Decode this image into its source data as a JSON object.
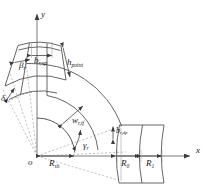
{
  "figure": {
    "kind": "engineering-geometry-diagram",
    "background_color": "#ffffff",
    "line_color": "#3c3c3c",
    "dashed_color": "#8c8c8c",
    "text_color": "#1a1a1a"
  },
  "axes": {
    "y_label": "y",
    "x_label": "x",
    "origin_label": "o"
  },
  "labels": {
    "beta": {
      "base": "β",
      "sub": "r"
    },
    "delta": {
      "base": "δ",
      "sub": "r"
    },
    "gamma": {
      "base": "γ",
      "sub": "r"
    },
    "b_sup": {
      "base": "b",
      "sub": "r,up"
    },
    "h_point": {
      "base": "h",
      "sub": "point"
    },
    "w_tf": {
      "base": "w",
      "sub": "r,tf"
    },
    "b_rdp": {
      "base": "b",
      "sub": "r,dp"
    },
    "R_sh": {
      "base": "R",
      "sub": "sh"
    },
    "R_0": {
      "base": "R",
      "sub": "0"
    },
    "R_1": {
      "base": "R",
      "sub": "1"
    }
  },
  "label_texts": {
    "beta": "βr",
    "delta": "δr",
    "gamma": "γr",
    "b_sup": "br,up",
    "h_point": "hpoint",
    "w_tf": "wr,tf",
    "b_rdp": "br,dp",
    "R_sh": "Rsh",
    "R_0": "R0",
    "R_1": "R1",
    "x": "x",
    "y": "y",
    "o": "o"
  },
  "geometry": {
    "origin_px": {
      "x": 37,
      "y": 156
    },
    "x_axis_end_px": {
      "x": 196,
      "y": 156
    },
    "y_axis_top_px": {
      "x": 37,
      "y": 12
    },
    "inner_radius_px": 38,
    "outer_radius_px": 86,
    "upper_arm_angle_deg": 108,
    "lower_arm_angle_deg": 2,
    "sector_sweep_deg": 106
  }
}
